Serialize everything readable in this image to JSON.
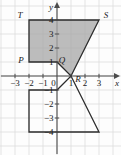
{
  "figure": {
    "axis_labels": {
      "x": "x",
      "y": "y"
    },
    "x_ticks": [
      {
        "value": -3,
        "label": "−3"
      },
      {
        "value": -2,
        "label": "−2"
      },
      {
        "value": -1,
        "label": "−1"
      },
      {
        "value": 0,
        "label": "0"
      },
      {
        "value": 1,
        "label": "1"
      },
      {
        "value": 2,
        "label": "2"
      },
      {
        "value": 3,
        "label": "3"
      }
    ],
    "y_ticks": [
      {
        "value": 4,
        "label": "4"
      },
      {
        "value": 3,
        "label": "3"
      },
      {
        "value": 2,
        "label": "2"
      },
      {
        "value": 1,
        "label": "1"
      },
      {
        "value": -1,
        "label": "−1"
      },
      {
        "value": -2,
        "label": "−2"
      },
      {
        "value": -3,
        "label": "−3"
      },
      {
        "value": -4,
        "label": "−4"
      }
    ],
    "point_labels": [
      {
        "name": "T",
        "label": "T",
        "x": -2,
        "y": 4
      },
      {
        "name": "S",
        "label": "S",
        "x": 3,
        "y": 4
      },
      {
        "name": "Q",
        "label": "Q",
        "x": 0,
        "y": 1
      },
      {
        "name": "R",
        "label": "R",
        "x": 1,
        "y": 0
      },
      {
        "name": "P",
        "label": "P",
        "x": -2,
        "y": 1
      }
    ],
    "colors": {
      "grid": "#dcdcdc",
      "axis": "#4c4c4c",
      "shape_stroke": "#2b2b2b",
      "shape_fill": "#a9a9a9",
      "text": "#1a1a1a",
      "background": "#fdfdfd"
    },
    "axis_ranges": {
      "x": [
        -3.6,
        3.8
      ],
      "y": [
        -4.8,
        4.6
      ]
    },
    "shaded_polygon": {
      "name": "PQRST",
      "vertices": [
        {
          "x": -2,
          "y": 4
        },
        {
          "x": 3,
          "y": 4
        },
        {
          "x": 1,
          "y": 0
        },
        {
          "x": 0,
          "y": 1
        },
        {
          "x": -2,
          "y": 1
        }
      ]
    },
    "lower_outline": {
      "name": "lower-region",
      "vertices": [
        {
          "x": -2,
          "y": -1
        },
        {
          "x": 0,
          "y": -1
        },
        {
          "x": 1,
          "y": 0
        },
        {
          "x": 3,
          "y": -4
        },
        {
          "x": -2,
          "y": -4
        }
      ]
    },
    "geometry": {
      "origin_px": {
        "x": 57,
        "y": 76
      },
      "unit_px": 14
    }
  }
}
